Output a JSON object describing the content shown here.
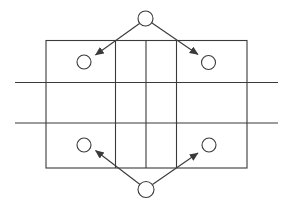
{
  "canvas": {
    "width": 288,
    "height": 206,
    "background_color": "#ffffff",
    "stroke_color": "#3a3a3a",
    "stroke_width": 1.1
  },
  "diagram": {
    "outer_rect": {
      "x": 46,
      "y": 40.5,
      "width": 201,
      "height": 127.5
    },
    "vertical_lines": [
      {
        "name": "center-column-left-line",
        "x": 115.5,
        "y1": 40.5,
        "y2": 168
      },
      {
        "name": "center-column-middle-line",
        "x": 146,
        "y1": 40.5,
        "y2": 168
      },
      {
        "name": "center-column-right-line",
        "x": 176.5,
        "y1": 40.5,
        "y2": 168
      }
    ],
    "horizontal_lines": [
      {
        "name": "upper-horizontal-line",
        "y": 82.5,
        "x1": 15,
        "x2": 278
      },
      {
        "name": "lower-horizontal-line",
        "y": 123,
        "x1": 15,
        "x2": 278
      }
    ],
    "corner_holes": [
      {
        "name": "top-left-hole",
        "cx": 84,
        "cy": 62,
        "r": 7
      },
      {
        "name": "top-right-hole",
        "cx": 208.5,
        "cy": 62.5,
        "r": 7
      },
      {
        "name": "bottom-left-hole",
        "cx": 84,
        "cy": 145,
        "r": 7
      },
      {
        "name": "bottom-right-hole",
        "cx": 209,
        "cy": 145,
        "r": 7
      }
    ],
    "callout_circles": [
      {
        "name": "top-callout-circle",
        "cx": 145.5,
        "cy": 18.5,
        "r": 7.5
      },
      {
        "name": "bottom-callout-circle",
        "cx": 146,
        "cy": 189.5,
        "r": 8
      }
    ],
    "arrows": [
      {
        "name": "top-left-arrow",
        "x1": 139.5,
        "y1": 23.5,
        "x2": 95.5,
        "y2": 55
      },
      {
        "name": "top-right-arrow",
        "x1": 152,
        "y1": 23,
        "x2": 198,
        "y2": 54.5
      },
      {
        "name": "bottom-left-arrow",
        "x1": 140,
        "y1": 184.5,
        "x2": 95.5,
        "y2": 150.5
      },
      {
        "name": "bottom-right-arrow",
        "x1": 152.5,
        "y1": 184.5,
        "x2": 198,
        "y2": 153
      }
    ]
  }
}
